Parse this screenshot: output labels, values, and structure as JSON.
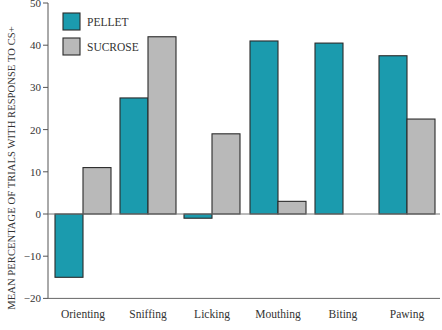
{
  "chart_data": {
    "type": "bar",
    "title": "",
    "xlabel": "",
    "ylabel": "MEAN PERCENTAGE OF TRIALS WITH RESPONSE TO CS+",
    "ylim": [
      -20,
      50
    ],
    "yticks": [
      50,
      40,
      30,
      20,
      10,
      0,
      -10,
      -20
    ],
    "ytick_labels": [
      "50",
      "40",
      "30",
      "20",
      "10",
      "0",
      "−10",
      "−20"
    ],
    "grid": false,
    "legend_position": "top-left",
    "categories": [
      "Orienting",
      "Sniffing",
      "Licking",
      "Mouthing",
      "Biting",
      "Pawing"
    ],
    "series": [
      {
        "name": "PELLET",
        "color": "#1b9bae",
        "values": [
          -15,
          27.5,
          -1,
          41,
          40.5,
          37.5
        ]
      },
      {
        "name": "SUCROSE",
        "color": "#b9b9b9",
        "values": [
          11,
          42,
          19,
          3,
          0,
          22.5
        ]
      }
    ]
  },
  "legend": {
    "items": [
      {
        "label": "PELLET",
        "color": "#1b9bae"
      },
      {
        "label": "SUCROSE",
        "color": "#b9b9b9"
      }
    ]
  }
}
